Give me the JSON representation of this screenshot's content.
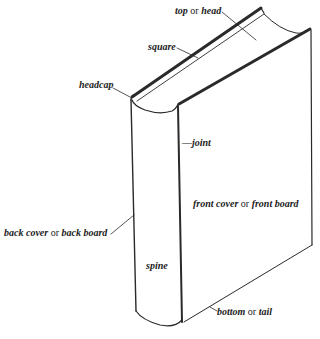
{
  "diagram": {
    "colors": {
      "line": "#2a2a2a",
      "background": "#ffffff"
    },
    "labels": {
      "top": {
        "term1": "top",
        "conn": " or ",
        "term2": "head"
      },
      "square": {
        "term1": "square"
      },
      "headcap": {
        "term1": "headcap"
      },
      "joint": {
        "prefix": "—",
        "term1": "joint"
      },
      "front": {
        "term1": "front cover",
        "conn": " or ",
        "term2": "front board"
      },
      "back": {
        "term1": "back cover",
        "conn": " or ",
        "term2": "back board"
      },
      "spine": {
        "term1": "spine"
      },
      "bottom": {
        "term1": "bottom",
        "conn": " or ",
        "term2": "tail"
      }
    }
  }
}
